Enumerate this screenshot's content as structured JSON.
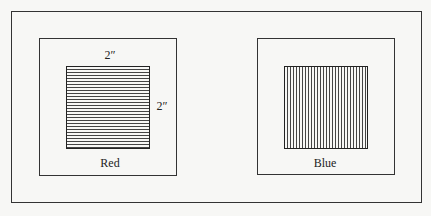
{
  "figure": {
    "panels": [
      {
        "id": "red",
        "label": "Red",
        "pattern": "horizontal-lines",
        "width_label": "2″",
        "height_label": "2″"
      },
      {
        "id": "blue",
        "label": "Blue",
        "pattern": "vertical-lines"
      }
    ]
  }
}
